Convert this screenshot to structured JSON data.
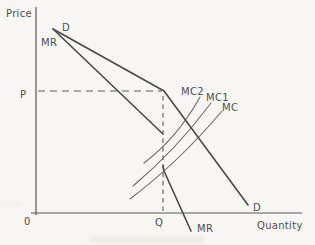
{
  "figure": {
    "type": "kinked-demand-curve-oligopoly-diagram",
    "colors": {
      "paper": "#f7f6f2",
      "curve": "#4a4a4a",
      "mc_curve": "#6a6a6a",
      "dashed_guide": "#5c5c5c",
      "text": "#4f4f4f"
    }
  },
  "axes": {
    "y_axis_label": "Price",
    "x_axis_label": "Quantity",
    "origin_label": "0",
    "y_axis_path": "M36,7 L36,215",
    "x_axis_path": "M31,213 L302,213"
  },
  "curves": {
    "demand": {
      "name": "D",
      "path": "M53,29 L164,91 L248,205"
    },
    "mr_upper": {
      "name": "MR",
      "path": "M53,29 L163,134"
    },
    "mr_lower": {
      "name": "MR",
      "path": "M163,166 L164,171 L191,231"
    },
    "mc": {
      "name": "MC",
      "path": "M130,199 Q180,161 222,111"
    },
    "mc1": {
      "name": "MC1",
      "path": "M133,186 Q176,150 211,103"
    },
    "mc2": {
      "name": "MC2",
      "path": "M144,163 Q178,137 200,97"
    },
    "price_guide": {
      "name": "P",
      "path": "M38,91 L162,91"
    },
    "quantity_guide": {
      "name": "Q",
      "path": "M163,96 L163,212"
    }
  },
  "labels": {
    "price_axis": {
      "text": "Price",
      "x": 6,
      "y": 17
    },
    "demand_top": {
      "text": "D",
      "x": 62,
      "y": 31
    },
    "mr_top": {
      "text": "MR",
      "x": 41,
      "y": 46
    },
    "price_level": {
      "text": "P",
      "x": 20,
      "y": 98
    },
    "mc2": {
      "text": "MC2",
      "x": 181,
      "y": 95
    },
    "mc1": {
      "text": "MC1",
      "x": 206,
      "y": 101
    },
    "mc": {
      "text": "MC",
      "x": 222,
      "y": 111
    },
    "demand_bottom": {
      "text": "D",
      "x": 253,
      "y": 211
    },
    "quantity_level": {
      "text": "Q",
      "x": 155,
      "y": 226
    },
    "mr_bottom": {
      "text": "MR",
      "x": 197,
      "y": 232
    },
    "origin": {
      "text": "0",
      "x": 24,
      "y": 225
    },
    "quantity_axis": {
      "text": "Quantity",
      "x": 257,
      "y": 229
    }
  }
}
